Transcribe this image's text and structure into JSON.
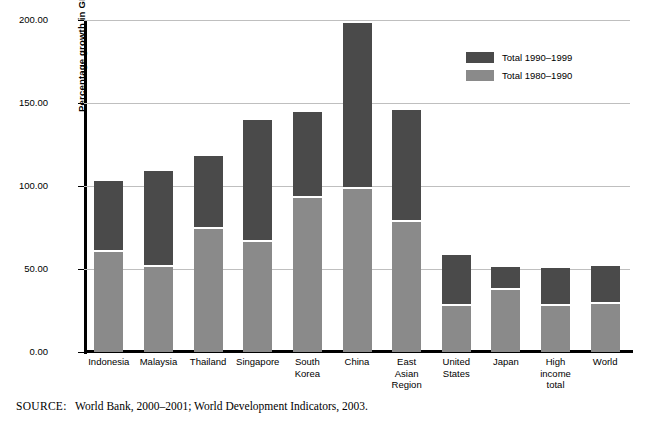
{
  "figure": {
    "source_note_keyword": "SOURCE:",
    "source_note_text": "World Bank, 2000–2001; World Development Indicators, 2003."
  },
  "legend": {
    "position": "top-right-inside",
    "entries": [
      {
        "label": "Total 1990–1999",
        "color": "#4a4a4a"
      },
      {
        "label": "Total 1980–1990",
        "color": "#8a8a8a"
      }
    ]
  },
  "chart_data": {
    "type": "bar",
    "subtype": "stacked-vertical",
    "title": "",
    "xlabel": "",
    "ylabel": "Percentage growth in GDP",
    "ylim": [
      0,
      200
    ],
    "yticks": [
      0,
      50,
      100,
      150,
      200
    ],
    "ytick_labels": [
      "0.00",
      "50.00",
      "100.00",
      "150.00",
      "200.00"
    ],
    "grid": "horizontal",
    "categories": [
      "Indonesia",
      "Malaysia",
      "Thailand",
      "Singapore",
      "South Korea",
      "China",
      "East Asian Region",
      "United States",
      "Japan",
      "High income total",
      "World"
    ],
    "category_label_lines": [
      [
        "Indonesia"
      ],
      [
        "Malaysia"
      ],
      [
        "Thailand"
      ],
      [
        "Singapore"
      ],
      [
        "South",
        "Korea"
      ],
      [
        "China"
      ],
      [
        "East",
        "Asian",
        "Region"
      ],
      [
        "United",
        "States"
      ],
      [
        "Japan"
      ],
      [
        "High",
        "income",
        "total"
      ],
      [
        "World"
      ]
    ],
    "series": [
      {
        "name": "Total 1980–1990",
        "color": "#8a8a8a",
        "values": [
          60,
          51.5,
          74,
          66.5,
          92.5,
          98.5,
          78.5,
          28,
          37.5,
          28,
          29
        ]
      },
      {
        "name": "Total 1990–1999",
        "color": "#4a4a4a",
        "values": [
          43,
          57.5,
          44,
          73.5,
          52,
          100,
          67.5,
          30.5,
          14,
          22.5,
          23
        ]
      }
    ],
    "totals": [
      103,
      109,
      118,
      140,
      144.5,
      198.5,
      146,
      58.5,
      51.5,
      50.5,
      52
    ]
  }
}
